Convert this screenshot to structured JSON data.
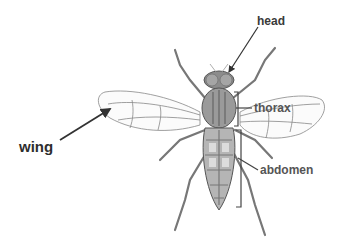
{
  "diagram": {
    "labels": {
      "head": "head",
      "thorax": "thorax",
      "abdomen": "abdomen",
      "wing": "wing"
    },
    "colors": {
      "label_text": "#3a3a3a",
      "outline": "#555555",
      "body_fill": "#9a9a9a",
      "background": "#ffffff"
    }
  }
}
